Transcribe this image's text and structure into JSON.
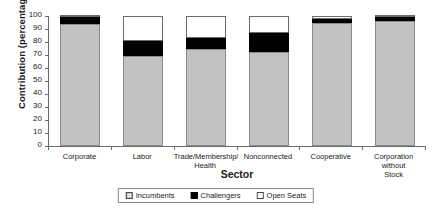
{
  "chart_data": {
    "type": "bar",
    "subtype": "stacked-vertical-percentage",
    "title": "",
    "xlabel": "Sector",
    "ylabel": "Contribution (percentage)",
    "ylim": [
      0,
      100
    ],
    "ytick_step": 10,
    "yticks": [
      "100",
      "90",
      "80",
      "70",
      "60",
      "50",
      "40",
      "30",
      "20",
      "10",
      "0"
    ],
    "grid": false,
    "legend_position": "bottom-center",
    "categories": [
      "Corporate",
      "Labor",
      "Trade/Membership/\nHealth",
      "Nonconnected",
      "Cooperative",
      "Corporation\nwithout\nStock"
    ],
    "series": [
      {
        "name": "Incumbents",
        "color": "#c2c2c2",
        "values": [
          94,
          69,
          75,
          72,
          95,
          96
        ]
      },
      {
        "name": "Challengers",
        "color": "#000000",
        "values": [
          5,
          12,
          8,
          15,
          3,
          3
        ]
      },
      {
        "name": "Open Seats",
        "color": "#ffffff",
        "values": [
          1,
          19,
          17,
          13,
          2,
          1
        ]
      }
    ]
  },
  "axes": {
    "x_title": "Sector",
    "y_title": "Contribution (percentage)"
  },
  "legend": {
    "items": [
      {
        "label": "Incumbents",
        "swatch": "grey-swatch"
      },
      {
        "label": "Challengers",
        "swatch": "black-swatch"
      },
      {
        "label": "Open Seats",
        "swatch": "white-swatch"
      }
    ]
  },
  "colors": {
    "incumbents": "#c2c2c2",
    "challengers": "#000000",
    "open_seats": "#ffffff",
    "axis": "#6b6b6b",
    "text": "#1a1a1a"
  }
}
